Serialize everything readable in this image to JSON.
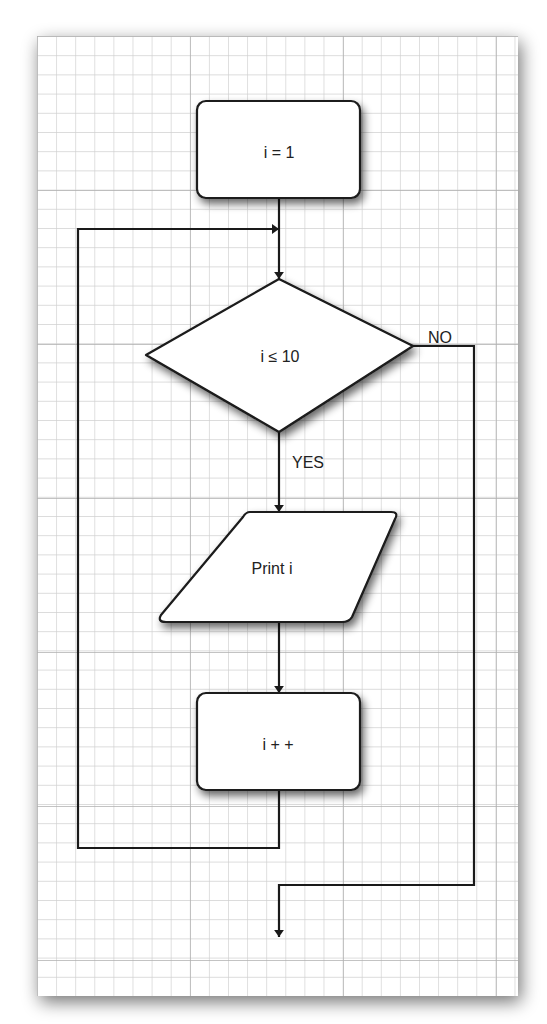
{
  "diagram": {
    "type": "flowchart",
    "nodes": [
      {
        "id": "init",
        "shape": "rounded-rectangle",
        "label": "i = 1"
      },
      {
        "id": "cond",
        "shape": "diamond",
        "label": "i ≤ 10"
      },
      {
        "id": "print",
        "shape": "parallelogram",
        "label": "Print i"
      },
      {
        "id": "incr",
        "shape": "rounded-rectangle",
        "label": "i + +"
      }
    ],
    "edges": [
      {
        "from": "init",
        "to": "cond",
        "label": ""
      },
      {
        "from": "cond",
        "to": "print",
        "label": "YES"
      },
      {
        "from": "print",
        "to": "incr",
        "label": ""
      },
      {
        "from": "incr",
        "to": "cond",
        "label": ""
      },
      {
        "from": "cond",
        "to": "exit",
        "label": "NO"
      }
    ]
  },
  "labels": {
    "init": "i = 1",
    "cond": "i ≤ 10",
    "print": "Print i",
    "incr": "i + +",
    "yes": "YES",
    "no": "NO"
  },
  "colors": {
    "paper": "#ffffff",
    "grid_minor": "#cfcfcf",
    "grid_major": "#b5b5b5",
    "stroke": "#1a1a1a",
    "shadow": "#888888"
  }
}
